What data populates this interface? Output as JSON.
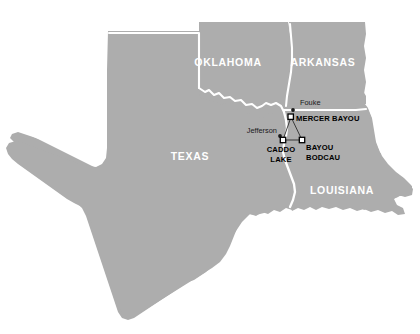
{
  "map": {
    "title": "Regional map of Texas, Oklahoma, Arkansas and Louisiana with study sites",
    "colors": {
      "land_fill": "#adadad",
      "background": "#ffffff",
      "border_stroke": "#ffffff",
      "state_label_color": "#ffffff",
      "site_label_color": "#000000",
      "city_label_color": "#1a1a1a",
      "marker_fill": "#ffffff",
      "marker_stroke": "#000000",
      "connector_stroke": "#2b2b2b"
    },
    "states": [
      {
        "id": "oklahoma",
        "label": "OKLAHOMA",
        "x": 228,
        "y": 66
      },
      {
        "id": "arkansas",
        "label": "ARKANSAS",
        "x": 323,
        "y": 66
      },
      {
        "id": "texas",
        "label": "TEXAS",
        "x": 190,
        "y": 160
      },
      {
        "id": "louisiana",
        "label": "LOUISIANA",
        "x": 342,
        "y": 194
      }
    ],
    "cities": [
      {
        "id": "fouke",
        "label": "Fouke",
        "label_x": 300,
        "label_y": 105,
        "dot_x": 293,
        "dot_y": 110
      },
      {
        "id": "jefferson",
        "label": "Jefferson",
        "label_x": 254,
        "label_y": 133,
        "dot_x": 280,
        "dot_y": 136
      }
    ],
    "sites": [
      {
        "id": "mercer-bayou",
        "label": "MERCER BAYOU",
        "label_lines": [
          "MERCER BAYOU"
        ],
        "marker_x": 291,
        "marker_y": 117,
        "label_x": 297,
        "label_y": 120,
        "anchor": "start"
      },
      {
        "id": "caddo-lake",
        "label": "CADDO LAKE",
        "label_lines": [
          "CADDO",
          "LAKE"
        ],
        "marker_x": 283,
        "marker_y": 140,
        "label_x": 281,
        "label_y": 152,
        "anchor": "middle"
      },
      {
        "id": "bayou-bodcau",
        "label": "BAYOU BODCAU",
        "label_lines": [
          "BAYOU",
          "BODCAU"
        ],
        "marker_x": 302,
        "marker_y": 140,
        "label_x": 306,
        "label_y": 150,
        "anchor": "start"
      }
    ],
    "connectors": [
      {
        "id": "mercer-to-caddo",
        "x1": 291,
        "y1": 117,
        "x2": 283,
        "y2": 140
      },
      {
        "id": "mercer-to-bodcau",
        "x1": 291,
        "y1": 117,
        "x2": 302,
        "y2": 140
      },
      {
        "id": "caddo-to-bodcau",
        "x1": 283,
        "y1": 140,
        "x2": 302,
        "y2": 140
      }
    ]
  }
}
